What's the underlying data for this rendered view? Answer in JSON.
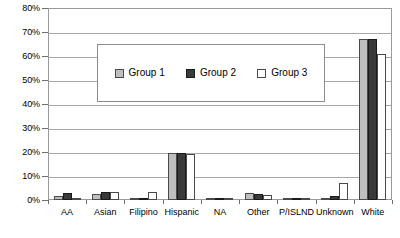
{
  "chart_data": {
    "type": "bar",
    "title": "",
    "xlabel": "",
    "ylabel": "",
    "ylim": [
      0,
      80
    ],
    "ytick_labels": [
      "0%",
      "10%",
      "20%",
      "30%",
      "40%",
      "50%",
      "60%",
      "70%",
      "80%"
    ],
    "ytick_values": [
      0,
      10,
      20,
      30,
      40,
      50,
      60,
      70,
      80
    ],
    "grid": true,
    "legend_position": "upper-center",
    "categories": [
      "AA",
      "Asian",
      "Filipino",
      "Hispanic",
      "NA",
      "Other",
      "P/ISLND",
      "Unknown",
      "White"
    ],
    "series": [
      {
        "name": "Group 1",
        "color": "#bfbfbf",
        "values": [
          1.5,
          2.5,
          0.3,
          19.5,
          0.4,
          3.0,
          0.3,
          1.0,
          67.0
        ]
      },
      {
        "name": "Group 2",
        "color": "#3a3a3a",
        "values": [
          3.0,
          3.5,
          1.0,
          19.5,
          0.5,
          2.5,
          1.0,
          1.5,
          67.0
        ]
      },
      {
        "name": "Group 3",
        "color": "#ffffff",
        "values": [
          0.5,
          3.5,
          3.5,
          19.0,
          0.5,
          2.0,
          0.3,
          7.0,
          61.0
        ]
      }
    ]
  },
  "legend": {
    "entries": [
      {
        "label": "Group 1",
        "swatch": "g1"
      },
      {
        "label": "Group 2",
        "swatch": "g2"
      },
      {
        "label": "Group 3",
        "swatch": "g3"
      }
    ]
  }
}
